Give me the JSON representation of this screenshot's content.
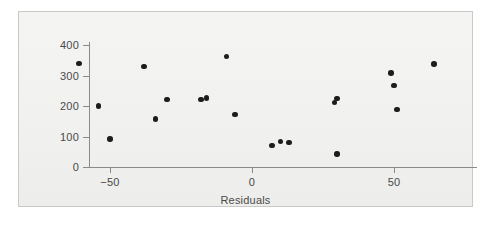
{
  "figure": {
    "background_color": "#ffffff",
    "panel_color": "#f2f2f0",
    "frame_color": "#c9c9c7",
    "axis_color": "#8a8a88",
    "point_color": "#1d1d1d"
  },
  "chart_data": {
    "type": "scatter",
    "title": "",
    "xlabel": "Residuals",
    "ylabel": "",
    "xlim": [
      -75,
      85
    ],
    "ylim": [
      -15,
      420
    ],
    "grid": false,
    "legend": null,
    "xticks": [
      -50,
      0,
      50
    ],
    "xtick_labels": [
      "−50",
      "0",
      "50"
    ],
    "yticks": [
      0,
      100,
      200,
      300,
      400
    ],
    "ytick_labels": [
      "0",
      "100",
      "200",
      "300",
      "400"
    ],
    "x": [
      -61,
      -54,
      -50,
      -38,
      -34,
      -30,
      -18,
      -16,
      -9,
      -6,
      7,
      10,
      13,
      29,
      30,
      50,
      49,
      50,
      51,
      64
    ],
    "y": [
      340,
      200,
      92,
      330,
      158,
      222,
      222,
      226,
      363,
      172,
      70,
      83,
      80,
      211,
      224,
      43,
      308,
      268,
      188,
      338
    ],
    "points": [
      {
        "x": -61,
        "y": 340
      },
      {
        "x": -54,
        "y": 200
      },
      {
        "x": -50,
        "y": 92
      },
      {
        "x": -38,
        "y": 330
      },
      {
        "x": -34,
        "y": 158
      },
      {
        "x": -30,
        "y": 222
      },
      {
        "x": -18,
        "y": 222
      },
      {
        "x": -16,
        "y": 226
      },
      {
        "x": -9,
        "y": 363
      },
      {
        "x": -6,
        "y": 172
      },
      {
        "x": 7,
        "y": 70
      },
      {
        "x": 10,
        "y": 83
      },
      {
        "x": 13,
        "y": 80
      },
      {
        "x": 29,
        "y": 211
      },
      {
        "x": 30,
        "y": 224
      },
      {
        "x": 30,
        "y": 43
      },
      {
        "x": 49,
        "y": 308
      },
      {
        "x": 50,
        "y": 268
      },
      {
        "x": 51,
        "y": 188
      },
      {
        "x": 64,
        "y": 338
      }
    ],
    "n_points": 20
  }
}
